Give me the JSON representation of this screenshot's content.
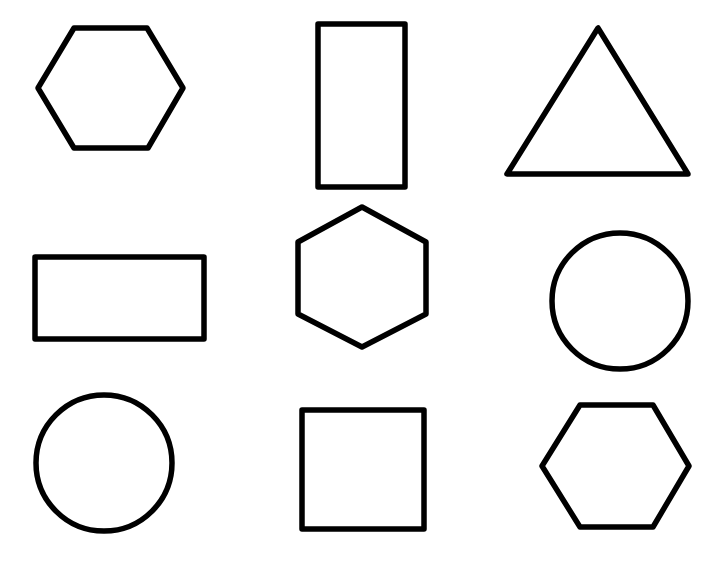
{
  "style": {
    "stroke": "#000000",
    "stroke_width": 5.5,
    "background": "#ffffff"
  },
  "shapes": [
    {
      "id": "hexagon-1",
      "type": "hexagon",
      "orientation": "flat-top",
      "row": 1,
      "col": 1,
      "points": "38,88 74,28 147,28 183,88 148,148 74,148"
    },
    {
      "id": "rectangle-tall",
      "type": "rectangle",
      "orientation": "portrait",
      "row": 1,
      "col": 2,
      "x": 318,
      "y": 24,
      "w": 87,
      "h": 163
    },
    {
      "id": "triangle",
      "type": "triangle",
      "row": 1,
      "col": 3,
      "points": "598,28 507,174 688,174"
    },
    {
      "id": "rectangle-wide",
      "type": "rectangle",
      "orientation": "landscape",
      "row": 2,
      "col": 1,
      "x": 35,
      "y": 257,
      "w": 169,
      "h": 82
    },
    {
      "id": "hexagon-2",
      "type": "hexagon",
      "orientation": "pointy-top",
      "row": 2,
      "col": 2,
      "points": "362,207 426,242 426,314 362,347 298,314 298,242"
    },
    {
      "id": "circle-right",
      "type": "circle",
      "row": 2,
      "col": 3,
      "cx": 620,
      "cy": 301,
      "r": 68
    },
    {
      "id": "circle-left",
      "type": "circle",
      "row": 3,
      "col": 1,
      "cx": 104,
      "cy": 463,
      "r": 68
    },
    {
      "id": "square",
      "type": "square",
      "row": 3,
      "col": 2,
      "x": 302,
      "y": 410,
      "w": 122,
      "h": 119
    },
    {
      "id": "hexagon-3",
      "type": "hexagon",
      "orientation": "flat-top",
      "row": 3,
      "col": 3,
      "points": "580,405 653,405 689,466 653,527 580,527 542,466"
    }
  ]
}
